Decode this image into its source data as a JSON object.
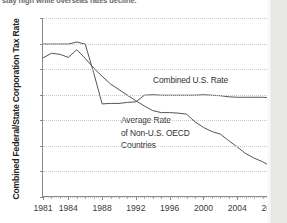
{
  "caption": {
    "clipped_line": "stay high while overseas rates decline."
  },
  "chart_data": {
    "type": "line",
    "title": "",
    "xlabel": "",
    "ylabel": "Combined Federal/State Corporation Tax Rate",
    "xlim": [
      1981,
      2008
    ],
    "ylim": [
      20,
      55
    ],
    "yticks": [
      20,
      25,
      30,
      35,
      40,
      45,
      50,
      55
    ],
    "xticks": [
      1981,
      1984,
      1988,
      1992,
      1996,
      2000,
      2004,
      2008
    ],
    "grid": true,
    "legend_position": "inline-annotations",
    "annotations": [
      {
        "text": "Combined U.S. Rate",
        "series": "Combined U.S. Rate"
      },
      {
        "text": "Average Rate",
        "series": "Average Rate of Non-U.S. OECD Countries"
      },
      {
        "text": "of Non-U.S. OECD",
        "series": "Average Rate of Non-U.S. OECD Countries"
      },
      {
        "text": "Countries",
        "series": "Average Rate of Non-U.S. OECD Countries"
      }
    ],
    "x": [
      1981,
      1982,
      1983,
      1984,
      1985,
      1986,
      1987,
      1988,
      1989,
      1990,
      1991,
      1992,
      1993,
      1994,
      1995,
      1996,
      1997,
      1998,
      1999,
      2000,
      2001,
      2002,
      2003,
      2004,
      2005,
      2006,
      2007,
      2008
    ],
    "series": [
      {
        "name": "Combined U.S. Rate",
        "color": "#555555",
        "values": [
          49.9,
          49.9,
          49.9,
          49.9,
          50.3,
          49.9,
          44.3,
          38.2,
          38.3,
          38.3,
          38.5,
          38.6,
          39.9,
          40.0,
          39.9,
          39.9,
          39.9,
          39.9,
          39.9,
          40.0,
          39.9,
          39.8,
          39.6,
          39.5,
          39.5,
          39.5,
          39.5,
          39.4
        ]
      },
      {
        "name": "Average Rate of Non-U.S. OECD Countries",
        "color": "#555555",
        "values": [
          47.2,
          48.1,
          47.9,
          47.3,
          48.8,
          47.1,
          45.2,
          43.6,
          42.1,
          41.0,
          39.9,
          38.8,
          37.8,
          36.9,
          36.5,
          36.5,
          36.4,
          36.2,
          34.7,
          33.6,
          32.8,
          32.3,
          31.0,
          29.8,
          28.5,
          27.6,
          26.9,
          26.0
        ]
      }
    ]
  },
  "axis": {
    "ytick_labels": [
      "55",
      "50",
      "45",
      "40",
      "35",
      "30",
      "25",
      "20"
    ],
    "xtick_labels": [
      "1981",
      "1984",
      "1988",
      "1992",
      "1996",
      "2000",
      "2004",
      "2008"
    ]
  }
}
